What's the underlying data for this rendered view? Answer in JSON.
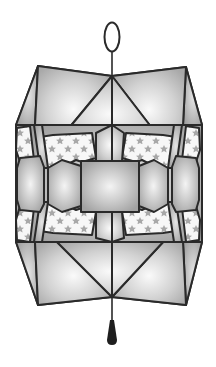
{
  "figure": {
    "subject": "Geometric origami-style paper lantern with star-patterned panels",
    "colors": {
      "background": "#ffffff",
      "outline": "#2a2a2a",
      "panel_light": "#f2f2f2",
      "panel_mid": "#c4c4c4",
      "panel_dark": "#9e9e9e",
      "star_panel_bg": "#f7f7f7",
      "star": "#a8a8a8",
      "tassel": "#1e1e1e"
    },
    "parts": {
      "ring": "hanging-ring",
      "cord": "hanging-cord",
      "top_cap": "top-pyramid",
      "band": "star-panel-band",
      "center_square": "center-square-panel",
      "bottom_cap": "bottom-pyramid",
      "tassel": "tassel"
    }
  }
}
